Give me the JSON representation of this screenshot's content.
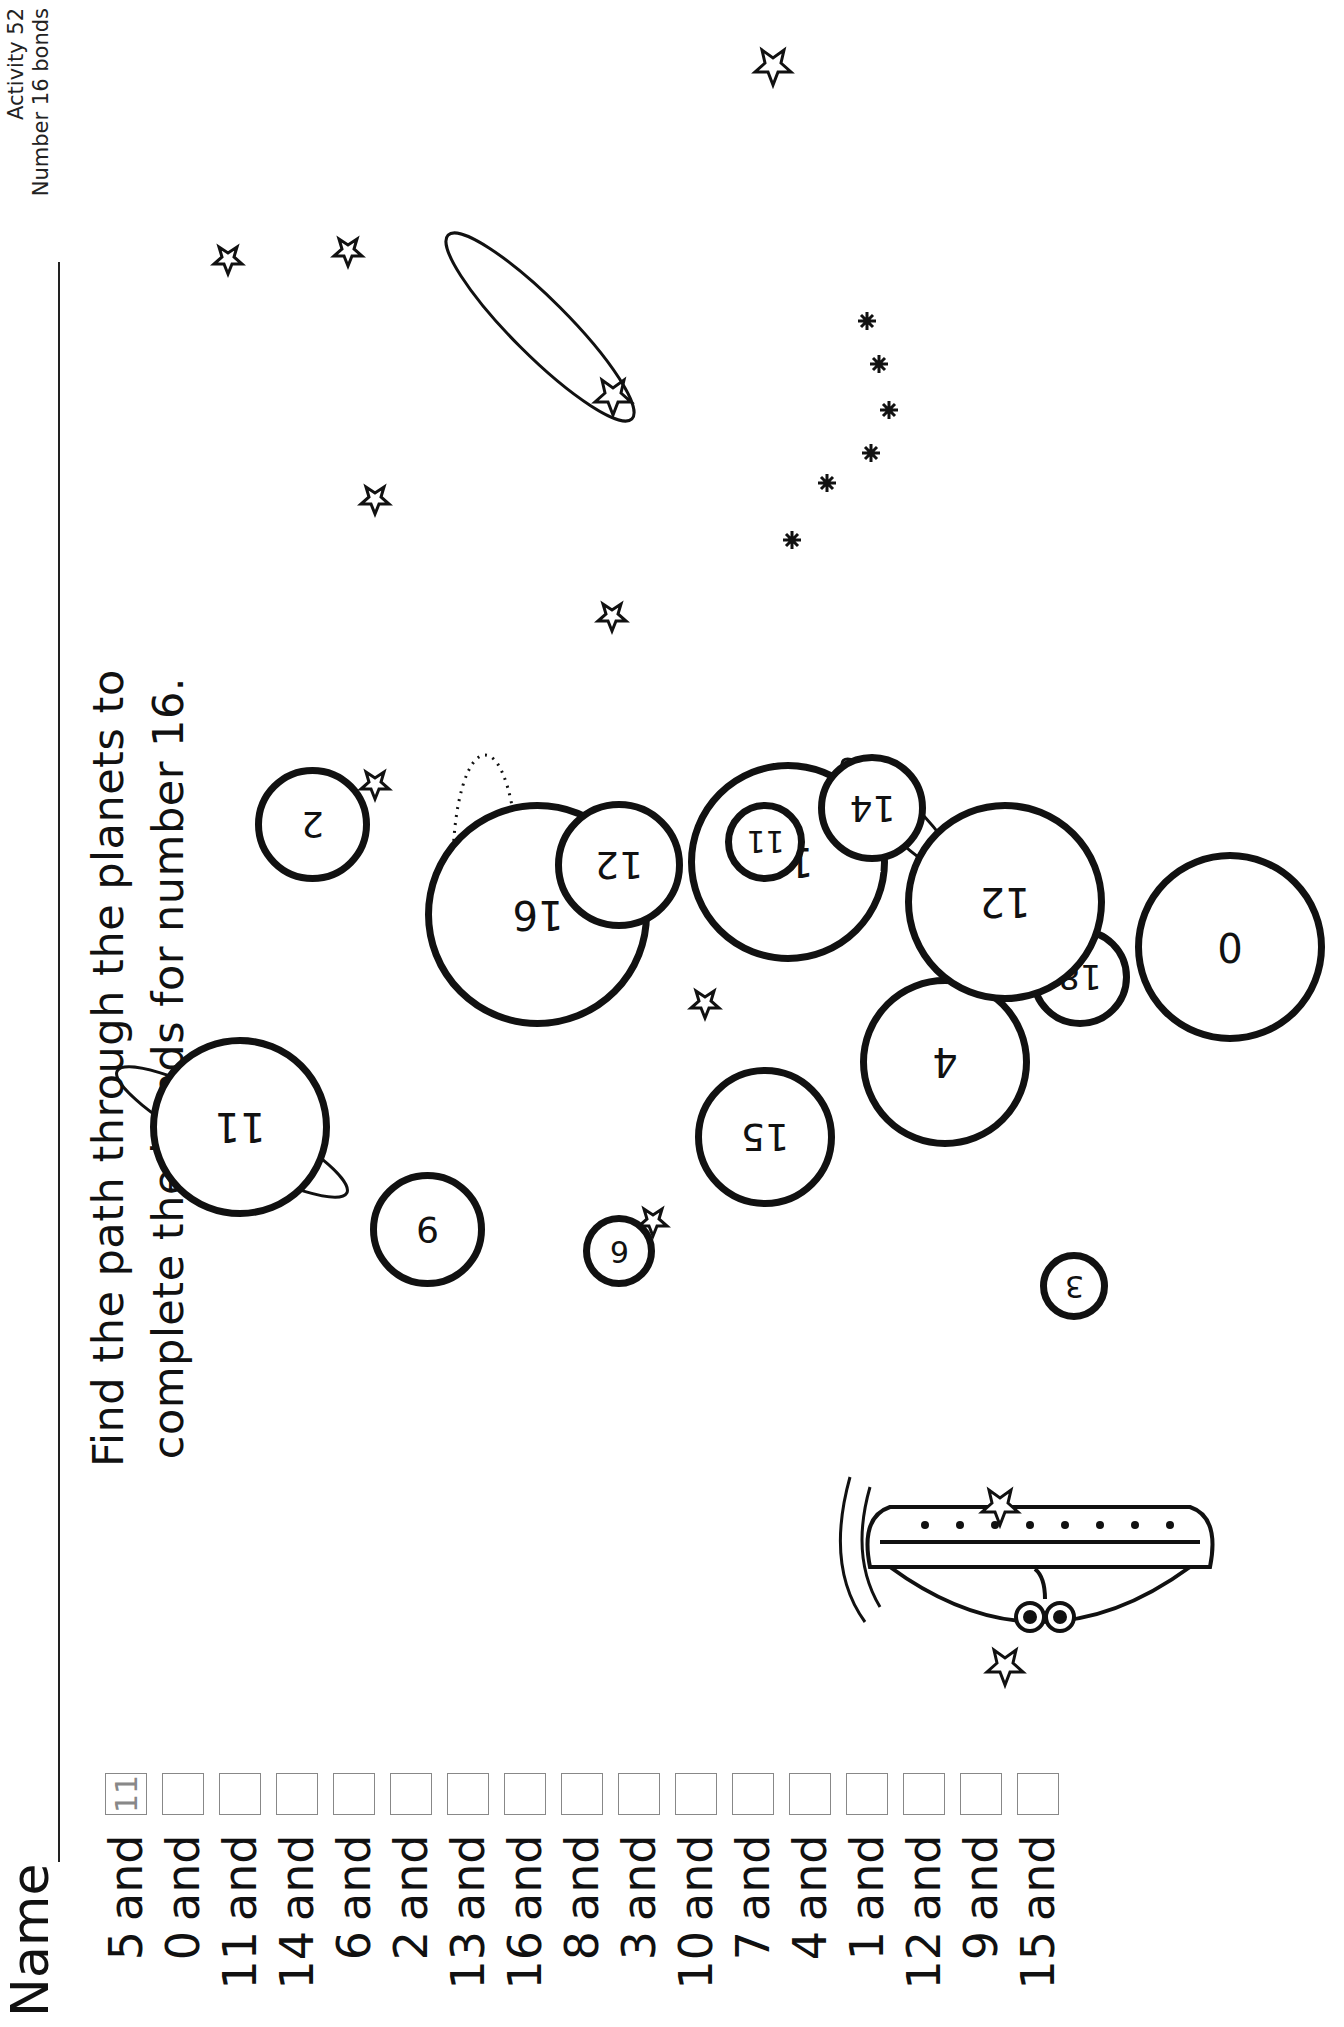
{
  "header": {
    "activity": "Activity 52",
    "subtitle": "Number 16 bonds"
  },
  "name_label": "Name",
  "instructions": {
    "line1": "Find the path through the planets to",
    "line2": "complete the bonds for number 16."
  },
  "labels": {
    "start": "Start",
    "finish": "Finish"
  },
  "bonds": [
    {
      "number": "5",
      "word": "and",
      "answer": "11"
    },
    {
      "number": "0",
      "word": "and",
      "answer": ""
    },
    {
      "number": "11",
      "word": "and",
      "answer": ""
    },
    {
      "number": "14",
      "word": "and",
      "answer": ""
    },
    {
      "number": "6",
      "word": "and",
      "answer": ""
    },
    {
      "number": "2",
      "word": "and",
      "answer": ""
    },
    {
      "number": "13",
      "word": "and",
      "answer": ""
    },
    {
      "number": "16",
      "word": "and",
      "answer": ""
    },
    {
      "number": "8",
      "word": "and",
      "answer": ""
    },
    {
      "number": "3",
      "word": "and",
      "answer": ""
    },
    {
      "number": "10",
      "word": "and",
      "answer": ""
    },
    {
      "number": "7",
      "word": "and",
      "answer": ""
    },
    {
      "number": "4",
      "word": "and",
      "answer": ""
    },
    {
      "number": "1",
      "word": "and",
      "answer": ""
    },
    {
      "number": "12",
      "word": "and",
      "answer": ""
    },
    {
      "number": "9",
      "word": "and",
      "answer": ""
    },
    {
      "number": "15",
      "word": "and",
      "answer": ""
    }
  ],
  "planets": [
    {
      "value": "11",
      "style": "ringed-start"
    },
    {
      "value": "9",
      "style": "plain"
    },
    {
      "value": "6",
      "style": "small"
    },
    {
      "value": "16",
      "style": "wavy"
    },
    {
      "value": "2",
      "style": "plain"
    },
    {
      "value": "15",
      "style": "plain"
    },
    {
      "value": "4",
      "style": "plain"
    },
    {
      "value": "3",
      "style": "small"
    },
    {
      "value": "18",
      "style": "plain"
    },
    {
      "value": "5",
      "style": "plain"
    },
    {
      "value": "10",
      "style": "plain"
    },
    {
      "value": "12",
      "style": "dotted-ring"
    },
    {
      "value": "0",
      "style": "plain"
    },
    {
      "value": "11",
      "style": "small"
    },
    {
      "value": "14",
      "style": "plain"
    },
    {
      "value": "12",
      "style": "continents"
    },
    {
      "value": "1",
      "style": "ringed"
    },
    {
      "value": "0",
      "style": "plain"
    },
    {
      "value": "8",
      "style": "banded"
    },
    {
      "value": "20",
      "style": "plain"
    },
    {
      "value": "13",
      "style": "small"
    },
    {
      "value": "3",
      "style": "plain"
    },
    {
      "value": "3",
      "style": "small"
    },
    {
      "value": "11",
      "style": "wavy-marks"
    },
    {
      "value": "16",
      "style": "small"
    },
    {
      "value": "8",
      "style": "striped"
    },
    {
      "value": "6",
      "style": "cratered"
    },
    {
      "value": "12",
      "style": "plain"
    },
    {
      "value": "5",
      "style": "plain"
    },
    {
      "value": "17",
      "style": "plain"
    },
    {
      "value": "1",
      "style": "small"
    },
    {
      "value": "9",
      "style": "ringed"
    },
    {
      "value": "15",
      "style": "plain"
    },
    {
      "value": "4",
      "style": "sparkles"
    },
    {
      "value": "10",
      "style": "small"
    },
    {
      "value": "14",
      "style": "plain"
    },
    {
      "value": "2",
      "style": "plain"
    },
    {
      "value": "1",
      "style": "swirled-finish"
    },
    {
      "value": "7",
      "style": "plain"
    },
    {
      "value": "5",
      "style": "plain"
    },
    {
      "value": "0",
      "style": "small"
    }
  ],
  "icons": {
    "star": "star-icon",
    "spaceship": "alien-spaceship-icon"
  }
}
